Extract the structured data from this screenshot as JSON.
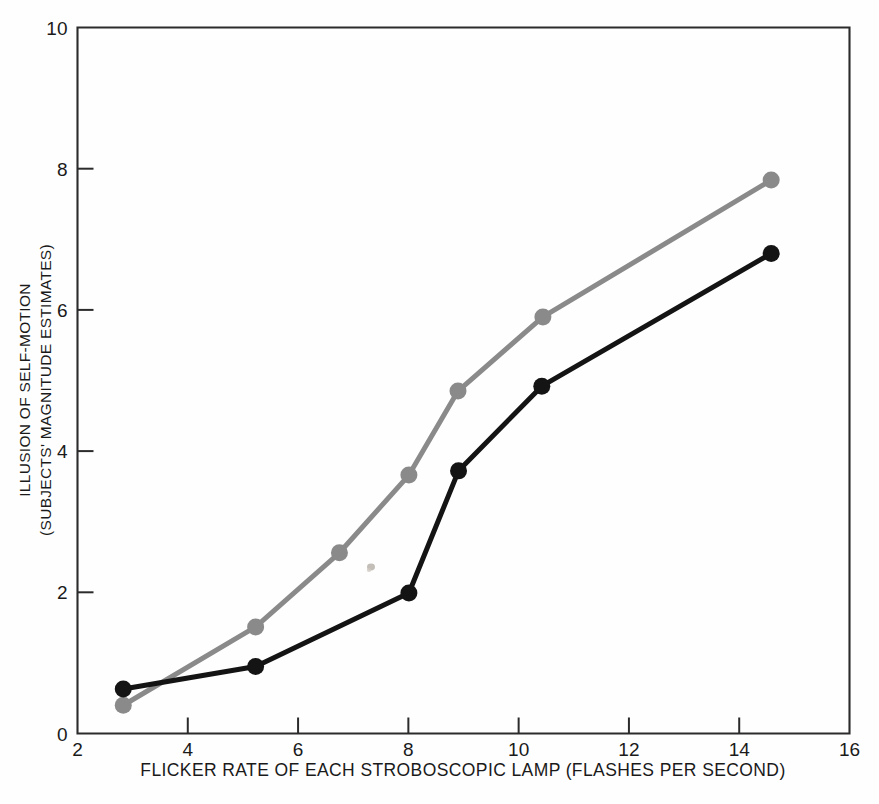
{
  "chart_data": {
    "type": "line",
    "title": "",
    "xlabel": "FLICKER RATE OF EACH STROBOSCOPIC LAMP (FLASHES PER SECOND)",
    "ylabel_line1": "ILLUSION OF SELF-MOTION",
    "ylabel_line2": "(SUBJECTS' MAGNITUDE ESTIMATES)",
    "xlim": [
      2,
      16
    ],
    "ylim": [
      0,
      10
    ],
    "xticks": [
      2,
      4,
      6,
      8,
      10,
      12,
      14,
      16
    ],
    "xtick_labels": [
      "2",
      "4",
      "6",
      "8",
      "10",
      "12",
      "14",
      "16"
    ],
    "yticks": [
      0,
      2,
      4,
      6,
      8,
      10
    ],
    "ytick_labels": [
      "0",
      "2",
      "4",
      "6",
      "8",
      "10"
    ],
    "grid": false,
    "legend": "none",
    "series": [
      {
        "name": "gray-series",
        "color": "#8a8a8a",
        "marker": "circle",
        "x": [
          2.83,
          5.23,
          6.75,
          8.01,
          8.9,
          10.44,
          14.58
        ],
        "y": [
          0.4,
          1.51,
          2.56,
          3.66,
          4.85,
          5.9,
          7.84
        ]
      },
      {
        "name": "black-series",
        "color": "#141414",
        "marker": "circle",
        "x": [
          2.83,
          5.23,
          8.01,
          8.91,
          10.42,
          14.58
        ],
        "y": [
          0.63,
          0.95,
          1.99,
          3.72,
          4.92,
          6.8
        ]
      }
    ]
  },
  "style": {
    "axis_color": "#2b2b2b",
    "background": "#fefefe",
    "gray_series_color": "#8a8a8a",
    "black_series_color": "#141414"
  }
}
